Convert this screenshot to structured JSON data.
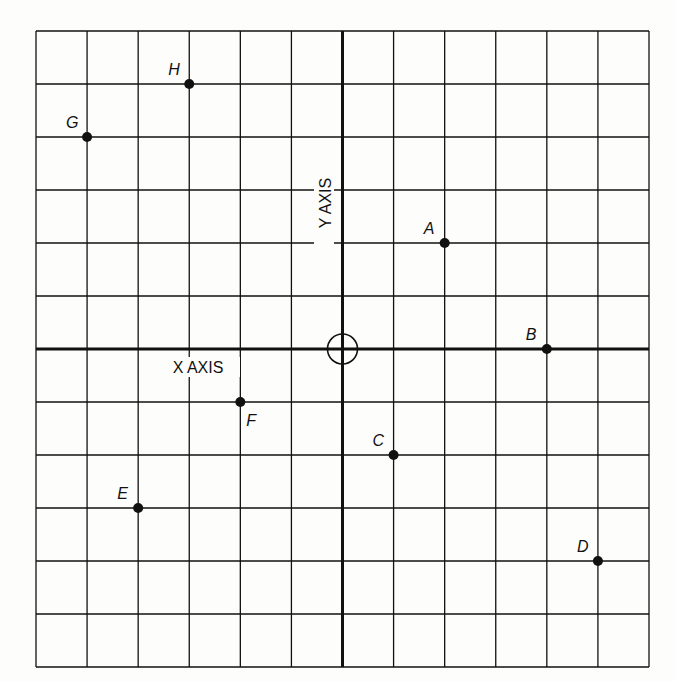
{
  "chart_data": {
    "type": "scatter",
    "title": "",
    "xlabel": "X AXIS",
    "ylabel": "Y AXIS",
    "xlim": [
      -6,
      6
    ],
    "ylim": [
      -6,
      6
    ],
    "grid": true,
    "grid_step": 1,
    "origin_marker": "circle",
    "legend": null,
    "points": [
      {
        "label": "A",
        "x": 2,
        "y": 2,
        "label_pos": "upper-left"
      },
      {
        "label": "B",
        "x": 4,
        "y": 0,
        "label_pos": "upper-left"
      },
      {
        "label": "C",
        "x": 1,
        "y": -2,
        "label_pos": "upper-left"
      },
      {
        "label": "D",
        "x": 5,
        "y": -4,
        "label_pos": "upper-left"
      },
      {
        "label": "E",
        "x": -4,
        "y": -3,
        "label_pos": "upper-left"
      },
      {
        "label": "F",
        "x": -2,
        "y": -1,
        "label_pos": "lower-right"
      },
      {
        "label": "G",
        "x": -5,
        "y": 4,
        "label_pos": "upper-left"
      },
      {
        "label": "H",
        "x": -3,
        "y": 5,
        "label_pos": "upper-left"
      }
    ]
  },
  "colors": {
    "background": "#fdfdfb",
    "ink": "#111111"
  }
}
